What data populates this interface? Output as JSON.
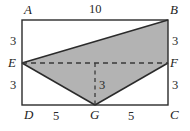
{
  "figure": {
    "kind": "geometry-diagram",
    "colors": {
      "stroke": "#2b2b2b",
      "shade_fill": "#b3b3b3",
      "dash": "#3a3a3a",
      "background": "#ffffff",
      "text": "#262626"
    },
    "vertices": [
      {
        "name": "A",
        "label": "A",
        "x": 22,
        "y": 20
      },
      {
        "name": "B",
        "label": "B",
        "x": 168,
        "y": 20
      },
      {
        "name": "C",
        "label": "C",
        "x": 168,
        "y": 105
      },
      {
        "name": "D",
        "label": "D",
        "x": 22,
        "y": 105
      },
      {
        "name": "E",
        "label": "E",
        "x": 22,
        "y": 63
      },
      {
        "name": "F",
        "label": "F",
        "x": 168,
        "y": 63
      },
      {
        "name": "G",
        "label": "G",
        "x": 95,
        "y": 105
      }
    ],
    "measures": {
      "top": "10",
      "left_upper": "3",
      "left_lower": "3",
      "right_upper": "3",
      "right_lower": "3",
      "inner_height": "3",
      "bottom_left": "5",
      "bottom_right": "5"
    },
    "shaded_polygon": "22,63 168,20 168,63 95,105",
    "solid_edges": [
      "22,20 168,20",
      "168,20 168,105",
      "168,105 22,105",
      "22,105 22,20",
      "22,63 168,20",
      "22,63 95,105",
      "95,105 168,63"
    ],
    "dashed_edges": [
      "22,63 168,63",
      "95,63 95,105"
    ]
  }
}
